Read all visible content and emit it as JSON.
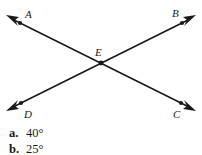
{
  "figure": {
    "background_color": "#ffffff",
    "stroke_color": "#1a1a1a",
    "labels": {
      "a": "A",
      "b": "B",
      "c": "C",
      "d": "D",
      "e": "E"
    },
    "points": {
      "A": {
        "x": 20,
        "y": 22
      },
      "B": {
        "x": 182,
        "y": 22
      },
      "C": {
        "x": 181,
        "y": 104
      },
      "D": {
        "x": 21,
        "y": 103
      },
      "E": {
        "x": 101,
        "y": 62
      }
    },
    "arrow_tips": {
      "A": {
        "x": 7,
        "y": 16
      },
      "B": {
        "x": 195,
        "y": 16
      },
      "C": {
        "x": 194,
        "y": 110
      },
      "D": {
        "x": 8,
        "y": 110
      }
    },
    "label_positions": {
      "A": {
        "x": 25,
        "y": 18
      },
      "B": {
        "x": 176,
        "y": 17
      },
      "C": {
        "x": 177,
        "y": 117
      },
      "D": {
        "x": 24,
        "y": 117
      },
      "E": {
        "x": 96,
        "y": 55
      }
    }
  },
  "answers": [
    {
      "key": "a.",
      "value": "40°"
    },
    {
      "key": "b.",
      "value": "25°"
    }
  ]
}
